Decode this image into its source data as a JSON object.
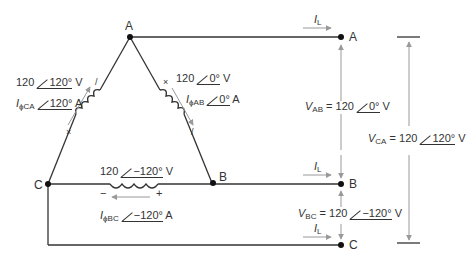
{
  "nodes": {
    "delta_a": "A",
    "delta_b": "B",
    "delta_c": "C",
    "line_a": "A",
    "line_b": "B",
    "line_c": "C"
  },
  "coils": {
    "ca": {
      "voltage_mag": "120",
      "voltage_angle": "120°",
      "voltage_unit": "V",
      "current_symbol": "I",
      "current_sub": "ϕCA",
      "current_angle": "120°",
      "current_unit": "A",
      "polarity_top": "/",
      "polarity_bottom": "×"
    },
    "ab": {
      "voltage_mag": "120",
      "voltage_angle": "0°",
      "voltage_unit": "V",
      "current_symbol": "I",
      "current_sub": "ϕAB",
      "current_angle": "0°",
      "current_unit": "A",
      "polarity_top": "×",
      "polarity_bottom": "/"
    },
    "bc": {
      "voltage_mag": "120",
      "voltage_angle": "−120°",
      "voltage_unit": "V",
      "current_symbol": "I",
      "current_sub": "ϕBC",
      "current_angle": "−120°",
      "current_unit": "A",
      "polarity_left": "−",
      "polarity_right": "+"
    }
  },
  "line_currents": [
    {
      "symbol": "I",
      "sub": "L"
    },
    {
      "symbol": "I",
      "sub": "L"
    },
    {
      "symbol": "I",
      "sub": "L"
    }
  ],
  "line_voltages": {
    "vab": {
      "symbol": "V",
      "sub": "AB",
      "eq": "= 120",
      "angle": "0°",
      "unit": "V"
    },
    "vbc": {
      "symbol": "V",
      "sub": "BC",
      "eq": "= 120",
      "angle": "−120°",
      "unit": "V"
    },
    "vca": {
      "symbol": "V",
      "sub": "CA",
      "eq": "= 120",
      "angle": "120°",
      "unit": "V"
    }
  },
  "colors": {
    "wire": "#333333",
    "arrow": "#999999"
  }
}
